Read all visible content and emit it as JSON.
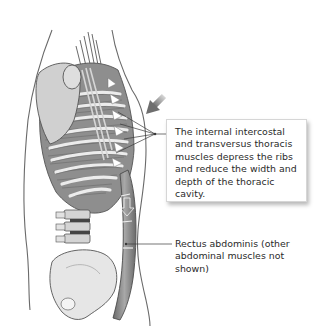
{
  "figure": {
    "colors": {
      "outline": "#5a5a5a",
      "bone": "#e4e4e4",
      "muscle": "#8a8a8a",
      "muscle_dark": "#5e5e5e",
      "arrow": "#8c8c8c",
      "leader": "#3a3a3a",
      "text": "#2a2a2a"
    }
  },
  "callouts": {
    "intercostal": {
      "text": "The internal intercostal and transversus thoracis muscles depress the ribs and reduce the width and depth of the thoracic cavity."
    },
    "rectus": {
      "text": "Rectus abdominis (other abdominal muscles not shown)"
    }
  },
  "icons": {
    "direction_arrow": "arrow-down-left"
  }
}
